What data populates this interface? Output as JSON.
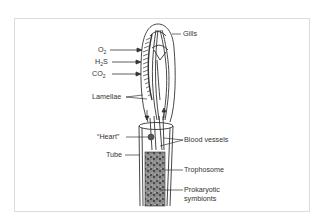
{
  "diagram": {
    "labels": {
      "o2": {
        "base": "O",
        "sub": "2"
      },
      "h2s": {
        "base1": "H",
        "sub": "2",
        "base2": "S"
      },
      "co2": {
        "base": "CO",
        "sub": "2"
      },
      "lamellae": "Lamellae",
      "gills": "Gills",
      "heart": "“Heart”",
      "tube": "Tube",
      "blood_vessels": "Blood vessels",
      "trophosome": "Trophosome",
      "prokaryotic_symbionts_line1": "Prokaryotic",
      "prokaryotic_symbionts_line2": "symbionts"
    },
    "colors": {
      "line": "#333333",
      "border": "#dcdcdc",
      "fill_trophosome": "#777777"
    }
  }
}
